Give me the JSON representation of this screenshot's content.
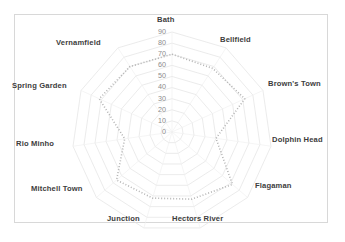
{
  "chart_data": {
    "type": "radar",
    "title": "",
    "categories": [
      "Bath",
      "Bellfield",
      "Brown's Town",
      "Dolphin Head",
      "Flagaman",
      "Hectors River",
      "Junction",
      "Mitchell Town",
      "Rio Minho",
      "Spring Garden",
      "Vernamfield"
    ],
    "values": [
      70,
      68,
      72,
      40,
      72,
      63,
      62,
      66,
      43,
      72,
      70
    ],
    "series": [
      {
        "name": "",
        "values": [
          70,
          68,
          72,
          40,
          72,
          63,
          62,
          66,
          43,
          72,
          70
        ]
      }
    ],
    "tick_labels": [
      "0",
      "10",
      "20",
      "30",
      "40",
      "50",
      "60",
      "70",
      "80",
      "90"
    ],
    "rlim": [
      0,
      90
    ],
    "rtick_step": 10,
    "grid": true,
    "grid_shape": "polygon",
    "legend": "none",
    "xlabel": "",
    "ylabel": "",
    "colors": {
      "series_line": "#b4b4b4",
      "grid_line": "#e2e2e2",
      "tick_text": "#8c8c8c",
      "category_text": "#3d3d3d",
      "frame_border": "#d8d8d8",
      "background": "#ffffff"
    },
    "line_style": "dotted"
  },
  "labels": {
    "bath": "Bath",
    "bellfield": "Bellfield",
    "browns_town": "Brown's Town",
    "dolphin_head": "Dolphin Head",
    "flagaman": "Flagaman",
    "hectors_river": "Hectors River",
    "junction": "Junction",
    "mitchell_town": "Mitchell Town",
    "rio_minho": "Rio Minho",
    "spring_garden": "Spring Garden",
    "vernamfield": "Vernamfield"
  }
}
